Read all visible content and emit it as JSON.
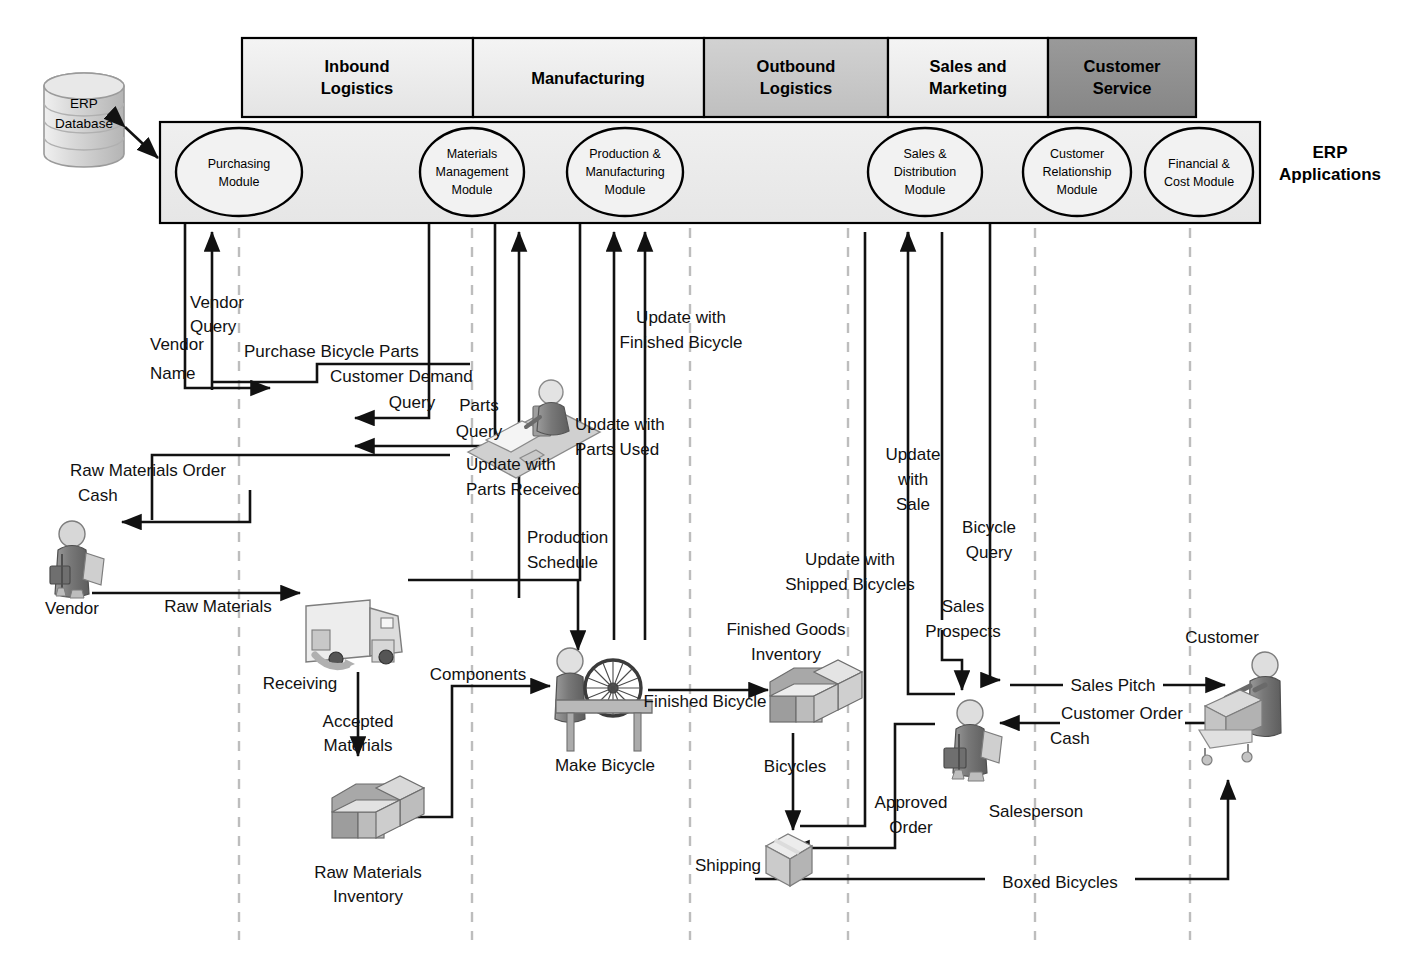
{
  "diagram": {
    "erp_applications_label": "ERP\nApplications",
    "erp_applications_line1": "ERP",
    "erp_applications_line2": "Applications",
    "database": {
      "line1": "ERP",
      "line2": "Database",
      "name": "ERP Database"
    }
  },
  "colors": {
    "lane_light": "#eeeeee",
    "lane_medium": "#c9c9c9",
    "lane_dark": "#8f8f8f",
    "band_fill": "#ececec",
    "ellipse_fill": "#f2f2f2",
    "line": "#111111",
    "dashed": "#bdbdbd"
  },
  "lanes": [
    {
      "id": "inbound",
      "line1": "Inbound",
      "line2": "Logistics",
      "label": "Inbound Logistics",
      "x": 242,
      "w": 231,
      "shade": "light"
    },
    {
      "id": "manufacturing",
      "line1": "Manufacturing",
      "line2": "",
      "label": "Manufacturing",
      "x": 473,
      "w": 231,
      "shade": "light"
    },
    {
      "id": "outbound",
      "line1": "Outbound",
      "line2": "Logistics",
      "label": "Outbound Logistics",
      "x": 704,
      "w": 184,
      "shade": "medium"
    },
    {
      "id": "sales",
      "line1": "Sales and",
      "line2": "Marketing",
      "label": "Sales and Marketing",
      "x": 888,
      "w": 160,
      "shade": "light"
    },
    {
      "id": "service",
      "line1": "Customer",
      "line2": "Service",
      "label": "Customer Service",
      "x": 1048,
      "w": 148,
      "shade": "dark"
    }
  ],
  "modules": [
    {
      "id": "purchasing",
      "lines": [
        "Purchasing",
        "Module"
      ],
      "label": "Purchasing Module",
      "cx": 239,
      "cy": 172,
      "rx": 63,
      "ry": 44
    },
    {
      "id": "materials-management",
      "lines": [
        "Materials",
        "Management",
        "Module"
      ],
      "label": "Materials Management Module",
      "cx": 472,
      "cy": 172,
      "rx": 52,
      "ry": 44
    },
    {
      "id": "production-manufacturing",
      "lines": [
        "Production &",
        "Manufacturing",
        "Module"
      ],
      "label": "Production & Manufacturing Module",
      "cx": 625,
      "cy": 172,
      "rx": 58,
      "ry": 44
    },
    {
      "id": "sales-distribution",
      "lines": [
        "Sales &",
        "Distribution",
        "Module"
      ],
      "label": "Sales & Distribution Module",
      "cx": 925,
      "cy": 172,
      "rx": 57,
      "ry": 44
    },
    {
      "id": "customer-relationship",
      "lines": [
        "Customer",
        "Relationship",
        "Module"
      ],
      "label": "Customer Relationship Module",
      "cx": 1077,
      "cy": 172,
      "rx": 54,
      "ry": 44
    },
    {
      "id": "financial-cost",
      "lines": [
        "Financial &",
        "Cost Module"
      ],
      "label": "Financial & Cost Module",
      "cx": 1199,
      "cy": 172,
      "rx": 54,
      "ry": 44
    }
  ],
  "entities": [
    {
      "id": "vendor",
      "label": "Vendor",
      "x": 72,
      "y": 608
    },
    {
      "id": "receiving",
      "label": "Receiving",
      "x": 300,
      "y": 683
    },
    {
      "id": "raw-materials-inventory",
      "lines": [
        "Raw Materials",
        "Inventory"
      ],
      "label": "Raw Materials Inventory",
      "x": 368,
      "y": 878
    },
    {
      "id": "make-bicycle",
      "label": "Make Bicycle",
      "x": 605,
      "y": 766
    },
    {
      "id": "finished-goods-inventory",
      "lines": [
        "Finished Goods",
        "Inventory"
      ],
      "label": "Finished Goods Inventory",
      "x": 786,
      "y": 630
    },
    {
      "id": "shipping",
      "label": "Shipping",
      "x": 731,
      "y": 868
    },
    {
      "id": "salesperson",
      "label": "Salesperson",
      "x": 1036,
      "y": 812
    },
    {
      "id": "customer",
      "label": "Customer",
      "x": 1222,
      "y": 637
    },
    {
      "id": "purchasing-agent",
      "label": "Purchasing Agent",
      "x": 524,
      "y": 425
    }
  ],
  "flows": [
    {
      "id": "vendor-query",
      "lines": [
        "Vendor",
        "Query"
      ],
      "label": "Vendor Query",
      "x": 222,
      "y": 303
    },
    {
      "id": "vendor-name",
      "lines": [
        "Vendor",
        "Name"
      ],
      "label": "Vendor Name",
      "x": 182,
      "y": 372
    },
    {
      "id": "purchase-bicycle-parts",
      "label": "Purchase Bicycle Parts",
      "x": 372,
      "y": 352
    },
    {
      "id": "customer-demand-query",
      "lines": [
        "Customer Demand",
        "Query"
      ],
      "label": "Customer Demand Query",
      "x": 412,
      "y": 378
    },
    {
      "id": "parts-query",
      "lines": [
        "Parts",
        "Query"
      ],
      "label": "Parts Query",
      "x": 487,
      "y": 408
    },
    {
      "id": "update-with-parts-received",
      "lines": [
        "Update with",
        "Parts Received"
      ],
      "label": "Update with Parts Received",
      "x": 542,
      "y": 464
    },
    {
      "id": "raw-materials-order",
      "label": "Raw Materials Order",
      "x": 130,
      "y": 474
    },
    {
      "id": "cash-vendor",
      "label": "Cash",
      "x": 99,
      "y": 498
    },
    {
      "id": "raw-materials",
      "label": "Raw Materials",
      "x": 230,
      "y": 607
    },
    {
      "id": "accepted-materials",
      "lines": [
        "Accepted",
        "Materials"
      ],
      "label": "Accepted Materials",
      "x": 362,
      "y": 722
    },
    {
      "id": "components",
      "label": "Components",
      "x": 480,
      "y": 676
    },
    {
      "id": "production-schedule",
      "lines": [
        "Production",
        "Schedule"
      ],
      "label": "Production Schedule",
      "x": 569,
      "y": 540
    },
    {
      "id": "update-with-parts-used",
      "lines": [
        "Update with",
        "Parts Used"
      ],
      "label": "Update with Parts Used",
      "x": 620,
      "y": 425
    },
    {
      "id": "update-with-finished-bicycle",
      "lines": [
        "Update with",
        "Finished Bicycle"
      ],
      "label": "Update with Finished Bicycle",
      "x": 681,
      "y": 319
    },
    {
      "id": "finished-bicycle",
      "label": "Finished Bicycle",
      "x": 716,
      "y": 700
    },
    {
      "id": "bicycles",
      "label": "Bicycles",
      "x": 795,
      "y": 767
    },
    {
      "id": "update-with-shipped-bicycles",
      "lines": [
        "Update with",
        "Shipped Bicycles"
      ],
      "label": "Update with Shipped Bicycles",
      "x": 850,
      "y": 560
    },
    {
      "id": "update-with-sale",
      "lines": [
        "Update",
        "with",
        "Sale"
      ],
      "label": "Update with Sale",
      "x": 913,
      "y": 455
    },
    {
      "id": "bicycle-query",
      "lines": [
        "Bicycle",
        "Query"
      ],
      "label": "Bicycle Query",
      "x": 990,
      "y": 529
    },
    {
      "id": "sales-prospects",
      "lines": [
        "Sales",
        "Prospects"
      ],
      "label": "Sales Prospects",
      "x": 966,
      "y": 607
    },
    {
      "id": "approved-order",
      "lines": [
        "Approved",
        "Order"
      ],
      "label": "Approved Order",
      "x": 911,
      "y": 803
    },
    {
      "id": "sales-pitch",
      "label": "Sales Pitch",
      "x": 1113,
      "y": 685
    },
    {
      "id": "customer-order",
      "label": "Customer Order",
      "x": 1118,
      "y": 713
    },
    {
      "id": "cash-customer",
      "label": "Cash",
      "x": 1073,
      "y": 738
    },
    {
      "id": "boxed-bicycles",
      "label": "Boxed Bicycles",
      "x": 1056,
      "y": 883
    }
  ]
}
